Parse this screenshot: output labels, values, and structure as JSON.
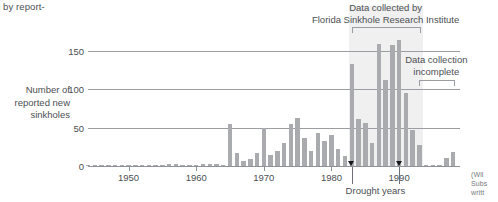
{
  "caption": {
    "top_fragment": "cted by report-",
    "credit_lines": [
      "(Wil",
      "Subs",
      "writt"
    ]
  },
  "chart_data": {
    "type": "bar",
    "title": "",
    "xlabel": "",
    "ylabel": "Number of reported new sinkholes",
    "ylabel_lines": [
      "Number of",
      "reported new",
      "sinkholes"
    ],
    "ylim": [
      0,
      175
    ],
    "yticks": [
      0,
      50,
      100,
      150
    ],
    "ytick_labels": [
      "0",
      "50",
      "100",
      "150"
    ],
    "xlim": [
      1944,
      1999
    ],
    "xticks": [
      1950,
      1960,
      1970,
      1980,
      1990
    ],
    "xtick_labels": [
      "1950",
      "1960",
      "1970",
      "1980",
      "1990"
    ],
    "grid": true,
    "legend": "none",
    "bar_color": "#a9abae",
    "band_color": "#f0f0f0",
    "x": [
      1944,
      1945,
      1946,
      1947,
      1948,
      1949,
      1950,
      1951,
      1952,
      1953,
      1954,
      1955,
      1956,
      1957,
      1958,
      1959,
      1960,
      1961,
      1962,
      1963,
      1964,
      1965,
      1966,
      1967,
      1968,
      1969,
      1970,
      1971,
      1972,
      1973,
      1974,
      1975,
      1976,
      1977,
      1978,
      1979,
      1980,
      1981,
      1982,
      1983,
      1984,
      1985,
      1986,
      1987,
      1988,
      1989,
      1990,
      1991,
      1992,
      1993,
      1994,
      1995,
      1996,
      1997,
      1998
    ],
    "values": [
      0,
      0,
      0,
      0,
      0,
      0,
      0,
      1,
      0,
      0,
      0,
      1,
      2,
      3,
      1,
      1,
      1,
      2,
      3,
      3,
      1,
      55,
      17,
      7,
      9,
      17,
      50,
      14,
      20,
      30,
      55,
      63,
      37,
      20,
      43,
      33,
      41,
      22,
      13,
      133,
      62,
      56,
      30,
      160,
      112,
      158,
      165,
      95,
      47,
      27,
      1,
      0,
      0,
      10,
      18
    ],
    "annotations": [
      {
        "name": "fsri-annotation",
        "lines": [
          "Data collected by",
          "Florida Sinkhole Research Institute"
        ],
        "bracket_range": [
          1983,
          1993
        ]
      },
      {
        "name": "data-incomplete-annotation",
        "lines": [
          "Data collection",
          "incomplete"
        ],
        "bracket_range": [
          1993,
          1998
        ]
      },
      {
        "name": "drought-annotation",
        "label": "Drought years",
        "marker_years": [
          1983,
          1990
        ]
      }
    ]
  }
}
